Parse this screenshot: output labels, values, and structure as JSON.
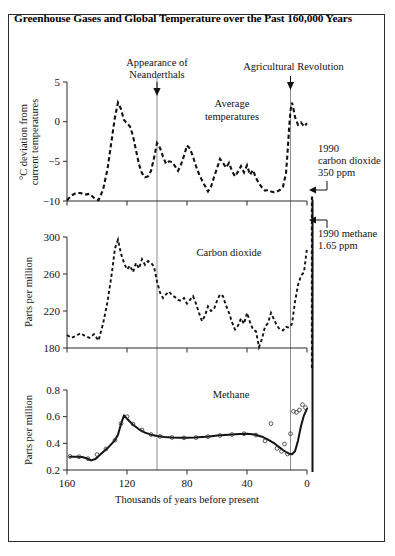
{
  "figure": {
    "title": "Greenhouse Gases and Global Temperature over the Past 160,000 Years",
    "xlabel": "Thousands of years before present",
    "background": "#ffffff",
    "frame_color": "#2b2b2b",
    "curve_color": "#121212",
    "guide_color": "#8c8c8c"
  },
  "annotations": {
    "neanderthals": "Appearance of\nNeanderthals",
    "neanderthals_line1": "Appearance of",
    "neanderthals_line2": "Neanderthals",
    "agricultural": "Agricultural Revolution",
    "co2_1990_line1": "1990",
    "co2_1990_line2": "carbon dioxide",
    "co2_1990_line3": "350 ppm",
    "methane_1990_line1": "1990 methane",
    "methane_1990_line2": "1.65 ppm",
    "neanderthals_x_kyr": 100,
    "agricultural_x_kyr": 11
  },
  "chart_data": [
    {
      "type": "line",
      "id": "temperature",
      "title": "Average temperatures",
      "inplot_label_line1": "Average",
      "inplot_label_line2": "temperatures",
      "ylabel_line1": "°C deviation from",
      "ylabel_line2": "current temperatures",
      "xlabel": "Thousands of years before present",
      "style": "dashed",
      "xlim": [
        160,
        0
      ],
      "ylim": [
        -10,
        5
      ],
      "yticks": [
        5,
        0,
        -5,
        -10
      ],
      "ytick_labels": [
        "5",
        "0",
        "−5",
        "−10"
      ],
      "xticks": [
        160,
        120,
        80,
        40,
        0
      ],
      "xtick_labels": [
        "160",
        "120",
        "80",
        "40",
        "0"
      ],
      "grid": false,
      "x": [
        160,
        157,
        154,
        151,
        148,
        145,
        142,
        139,
        136,
        133,
        130,
        128,
        126,
        124,
        122,
        120,
        118,
        116,
        114,
        112,
        110,
        108,
        106,
        104,
        102,
        100,
        98,
        96,
        94,
        92,
        90,
        88,
        86,
        84,
        82,
        80,
        78,
        76,
        74,
        72,
        70,
        68,
        66,
        64,
        62,
        60,
        58,
        56,
        54,
        52,
        50,
        48,
        46,
        44,
        42,
        40,
        38,
        36,
        34,
        32,
        30,
        28,
        26,
        24,
        22,
        20,
        18,
        16,
        14,
        13,
        12,
        11,
        10,
        9,
        8,
        6,
        4,
        2,
        0
      ],
      "y": [
        -9.9,
        -9.3,
        -9.0,
        -9.0,
        -9.2,
        -9.1,
        -9.6,
        -9.9,
        -8.6,
        -6.0,
        -2.0,
        0.6,
        2.4,
        1.6,
        0.2,
        -0.2,
        -0.6,
        -1.8,
        -3.6,
        -5.4,
        -6.5,
        -7.0,
        -6.9,
        -6.2,
        -4.6,
        -2.7,
        -3.3,
        -4.4,
        -5.3,
        -5.0,
        -5.1,
        -5.6,
        -6.2,
        -5.4,
        -4.3,
        -3.0,
        -3.4,
        -4.4,
        -5.6,
        -6.6,
        -7.4,
        -8.1,
        -8.8,
        -8.2,
        -7.0,
        -5.9,
        -4.7,
        -5.2,
        -5.8,
        -5.2,
        -6.2,
        -6.9,
        -6.3,
        -5.6,
        -6.4,
        -5.5,
        -6.7,
        -6.1,
        -7.1,
        -7.8,
        -8.3,
        -8.7,
        -8.6,
        -8.8,
        -8.9,
        -8.8,
        -8.6,
        -8.2,
        -6.5,
        -4.0,
        -1.0,
        1.4,
        2.4,
        1.6,
        0.6,
        -0.4,
        -0.1,
        -0.6,
        -0.2
      ]
    },
    {
      "type": "line",
      "id": "carbon_dioxide",
      "title": "Carbon dioxide",
      "inplot_label": "Carbon dioxide",
      "ylabel": "Parts per million",
      "style": "dashed",
      "units": "ppm",
      "xlim": [
        160,
        0
      ],
      "ylim": [
        180,
        300
      ],
      "yticks": [
        300,
        260,
        220,
        180
      ],
      "ytick_labels": [
        "300",
        "260",
        "220",
        "180"
      ],
      "xticks": [
        160,
        120,
        80,
        40,
        0
      ],
      "xtick_labels": [
        "160",
        "120",
        "80",
        "40",
        "0"
      ],
      "grid": false,
      "value_1990": 350,
      "x": [
        160,
        157,
        154,
        151,
        148,
        145,
        142,
        139,
        136,
        133,
        130,
        128,
        126,
        124,
        122,
        120,
        118,
        116,
        114,
        112,
        110,
        108,
        106,
        104,
        102,
        100,
        98,
        96,
        94,
        92,
        90,
        88,
        86,
        84,
        82,
        80,
        78,
        76,
        74,
        72,
        70,
        68,
        66,
        64,
        62,
        60,
        58,
        56,
        54,
        52,
        50,
        48,
        46,
        44,
        42,
        40,
        38,
        36,
        34,
        32,
        30,
        28,
        26,
        24,
        22,
        20,
        18,
        16,
        14,
        12,
        10,
        8,
        6,
        4,
        2,
        0
      ],
      "y": [
        194,
        191,
        193,
        196,
        193,
        191,
        195,
        188,
        206,
        230,
        262,
        288,
        297,
        282,
        272,
        265,
        269,
        262,
        272,
        266,
        276,
        270,
        274,
        272,
        268,
        252,
        240,
        234,
        238,
        241,
        237,
        235,
        232,
        231,
        234,
        228,
        232,
        236,
        228,
        218,
        209,
        215,
        225,
        220,
        222,
        231,
        238,
        236,
        226,
        218,
        208,
        200,
        204,
        212,
        206,
        218,
        208,
        200,
        198,
        181,
        190,
        203,
        207,
        218,
        211,
        204,
        200,
        199,
        203,
        202,
        206,
        230,
        248,
        258,
        262,
        288
      ]
    },
    {
      "type": "line",
      "id": "methane",
      "title": "Methane",
      "inplot_label": "Methane",
      "ylabel": "Parts per million",
      "style": "solid",
      "units": "ppm",
      "xlim": [
        160,
        0
      ],
      "ylim": [
        0.2,
        0.8
      ],
      "yticks": [
        0.8,
        0.6,
        0.4,
        0.2
      ],
      "ytick_labels": [
        "0.8",
        "0.6",
        "0.4",
        "0.2"
      ],
      "xticks": [
        160,
        120,
        80,
        40,
        0
      ],
      "xtick_labels": [
        "160",
        "120",
        "80",
        "40",
        "0"
      ],
      "grid": false,
      "value_1990": 1.65,
      "x": [
        158,
        154,
        150,
        147,
        144,
        141,
        138,
        135,
        132,
        130,
        128,
        126,
        124,
        122,
        120,
        116,
        112,
        108,
        104,
        100,
        95,
        90,
        85,
        80,
        75,
        70,
        65,
        60,
        55,
        50,
        45,
        40,
        35,
        30,
        26,
        22,
        19,
        16,
        14,
        12,
        10,
        8,
        6,
        4,
        2,
        0
      ],
      "y": [
        0.3,
        0.3,
        0.297,
        0.288,
        0.272,
        0.282,
        0.315,
        0.345,
        0.375,
        0.4,
        0.425,
        0.465,
        0.545,
        0.61,
        0.585,
        0.54,
        0.505,
        0.48,
        0.465,
        0.455,
        0.447,
        0.443,
        0.441,
        0.441,
        0.443,
        0.447,
        0.452,
        0.458,
        0.462,
        0.466,
        0.47,
        0.472,
        0.466,
        0.45,
        0.428,
        0.402,
        0.375,
        0.35,
        0.335,
        0.322,
        0.318,
        0.34,
        0.42,
        0.53,
        0.61,
        0.66
      ],
      "markers_x": [
        158,
        152,
        146,
        140,
        134,
        128,
        124,
        120,
        116,
        110,
        104,
        98,
        90,
        82,
        74,
        66,
        58,
        50,
        42,
        34,
        28,
        24,
        20,
        17,
        15,
        13,
        11,
        9,
        7,
        5,
        3,
        1
      ],
      "markers_y": [
        0.302,
        0.299,
        0.285,
        0.316,
        0.358,
        0.424,
        0.548,
        0.6,
        0.545,
        0.5,
        0.466,
        0.452,
        0.444,
        0.441,
        0.443,
        0.45,
        0.459,
        0.466,
        0.472,
        0.462,
        0.418,
        0.548,
        0.362,
        0.34,
        0.395,
        0.32,
        0.472,
        0.64,
        0.632,
        0.65,
        0.69,
        0.668
      ]
    }
  ]
}
